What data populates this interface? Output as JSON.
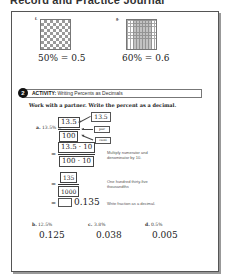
{
  "page": {
    "title": "Record and Practice Journal"
  },
  "models": [
    {
      "label": "f.",
      "pattern": "checkerboard",
      "equation": "50% = 0.5"
    },
    {
      "label": "g.",
      "pattern": "shaded-columns",
      "equation": "60% = 0.6"
    }
  ],
  "activity": {
    "number": "2",
    "heading_bold": "ACTIVITY:",
    "heading_text": " Writing Percents as Decimals",
    "instruction": "Work with a partner. Write the percent as a decimal.",
    "example": {
      "label": "a.",
      "prompt": "13.5% =",
      "step1": {
        "numerator": "13.5",
        "denominator": "100"
      },
      "tags": {
        "top": "13.5",
        "mid": "per",
        "bottom": "cent"
      },
      "step2": {
        "numerator": "13.5 · 10",
        "denominator": "100 · 10",
        "note": "Multiply numerator and denominator by 10."
      },
      "step3": {
        "numerator": "135",
        "denominator": "1000",
        "note": "One hundred thirty-five thousandths"
      },
      "step4": {
        "answer": "0.135",
        "note": "Write fraction as a decimal."
      },
      "equals": "="
    },
    "problems": [
      {
        "label": "b.",
        "percent": "12.5%",
        "answer": "0.125"
      },
      {
        "label": "c.",
        "percent": "3.8%",
        "answer": "0.038"
      },
      {
        "label": "d.",
        "percent": "0.5%",
        "answer": "0.005"
      }
    ]
  }
}
